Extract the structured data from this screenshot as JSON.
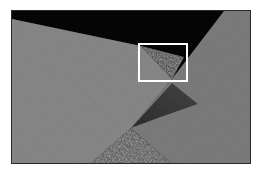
{
  "figure": {
    "type": "grayscale photograph",
    "colors": {
      "background": "#ffffff",
      "dark_region": "#050505",
      "left_surface": "#8a8a8a",
      "right_surface": "#7c7c7c",
      "shadow": "#3a3a3a",
      "bottom_triangle": "#3f3f3f",
      "highlight_box": "#ffffff",
      "frame_border": "#2a2a2a"
    },
    "highlight_box": {
      "x": 138,
      "y": 43,
      "width": 50,
      "height": 39
    }
  }
}
